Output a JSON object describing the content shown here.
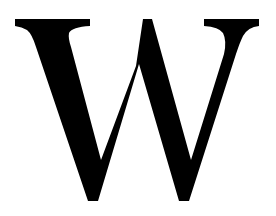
{
  "image": {
    "letter": "W",
    "colors": {
      "background": "#ffffff",
      "glyph": "#000000"
    }
  }
}
